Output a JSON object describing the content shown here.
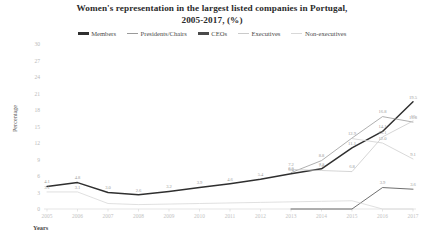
{
  "chart_data": {
    "type": "line",
    "title": "Women's representation in the largest listed companies in Portugal, 2005-2017, (%)",
    "title_line1": "Women's representation in the largest listed companies in Portugal,",
    "title_line2": "2005-2017, (%)",
    "xlabel": "Years",
    "ylabel": "Percentage",
    "grid": false,
    "legend_position": "top",
    "ylim": [
      0,
      30
    ],
    "yticks": [
      0,
      3,
      6,
      9,
      12,
      15,
      18,
      21,
      24,
      27,
      30
    ],
    "categories": [
      "2005",
      "2006",
      "2007",
      "2008",
      "2009",
      "2010",
      "2011",
      "2012",
      "2013",
      "2014",
      "2015",
      "2016",
      "2017"
    ],
    "series": [
      {
        "name": "Members",
        "color": "#2f2f2f",
        "values": [
          4.1,
          4.8,
          3.0,
          2.6,
          3.2,
          3.9,
          4.6,
          5.4,
          6.4,
          7.3,
          11.1,
          14.1,
          19.5
        ],
        "labels": [
          "4.1",
          "4.8",
          "3.0",
          "2.6",
          "3.2",
          "3.9",
          "4.6",
          "5.4",
          "6.4",
          "7.3",
          "11.1",
          "14.1",
          "19.5"
        ]
      },
      {
        "name": "Presidents/Chairs",
        "color": "#9a9a9a",
        "values": [
          null,
          null,
          null,
          null,
          null,
          null,
          null,
          null,
          6.6,
          8.8,
          12.9,
          16.8,
          15.8
        ],
        "labels": [
          "",
          "",
          "",
          "",
          "",
          "",
          "",
          "",
          "6.6",
          "8.8",
          "12.9",
          "16.8",
          "15.8"
        ]
      },
      {
        "name": "CEOs",
        "color": "#4a4a4a",
        "values": [
          null,
          null,
          null,
          null,
          null,
          null,
          null,
          null,
          0.0,
          0.0,
          0.0,
          3.9,
          3.6
        ],
        "labels": [
          "",
          "",
          "",
          "",
          "",
          "",
          "",
          "",
          "",
          "",
          "",
          "3.9",
          "3.6"
        ]
      },
      {
        "name": "Executives",
        "color": "#cacaca",
        "values": [
          null,
          null,
          null,
          null,
          null,
          null,
          null,
          null,
          7.2,
          7.0,
          6.8,
          13.1,
          16.0
        ],
        "labels": [
          "",
          "",
          "",
          "",
          "",
          "",
          "",
          "",
          "7.2",
          "7.0",
          "6.8",
          "13.1",
          "16"
        ]
      },
      {
        "name": "Non-executives",
        "color": "#d8d8d8",
        "values": [
          3.1,
          3.1,
          1.0,
          0.8,
          0.9,
          1.0,
          1.1,
          1.2,
          1.3,
          1.4,
          1.5,
          0.0,
          0.0
        ],
        "labels": [
          "3.1",
          "3.1",
          "",
          "",
          "",
          "",
          "",
          "",
          "",
          "",
          "",
          "",
          ""
        ]
      },
      {
        "name": "Non-executives-upper",
        "color": "#cfcfcf",
        "values": [
          null,
          null,
          null,
          null,
          null,
          null,
          null,
          null,
          null,
          null,
          12.8,
          12.0,
          9.1
        ],
        "labels": [
          "",
          "",
          "",
          "",
          "",
          "",
          "",
          "",
          "",
          "",
          "",
          "12.0",
          "9.1"
        ]
      }
    ]
  },
  "legend": {
    "items": [
      {
        "label": "Members",
        "color": "#2f2f2f"
      },
      {
        "label": "Presidents/Chairs",
        "color": "#9a9a9a"
      },
      {
        "label": "CEOs",
        "color": "#4a4a4a"
      },
      {
        "label": "Executives",
        "color": "#cacaca"
      },
      {
        "label": "Non-executives",
        "color": "#d8d8d8"
      }
    ]
  }
}
